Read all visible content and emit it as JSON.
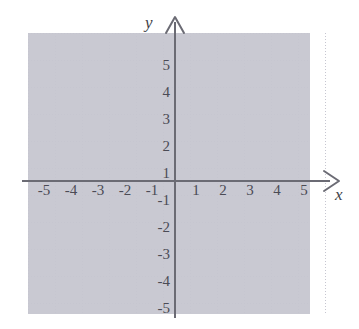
{
  "figure": {
    "kind": "cartesian-coordinate-plane",
    "axis_labels": {
      "x": "x",
      "y": "y"
    },
    "colors": {
      "background": "#ffffff",
      "grid": "#c6c6d0",
      "axis": "#6b6b74",
      "label_text": "#4b4b55"
    }
  },
  "chart_data": {
    "type": "scatter",
    "title": "",
    "xlabel": "x",
    "ylabel": "y",
    "xlim": [
      -5.5,
      5.5
    ],
    "ylim": [
      -5.5,
      5.5
    ],
    "grid": true,
    "legend": "none",
    "series": [],
    "x_ticks": [
      "-5",
      "-4",
      "-3",
      "-2",
      "-1",
      "1",
      "2",
      "3",
      "4",
      "5"
    ],
    "y_ticks": [
      "5",
      "4",
      "3",
      "2",
      "1",
      "-1",
      "-2",
      "-3",
      "-4",
      "-5"
    ],
    "x_tick_values": [
      -5,
      -4,
      -3,
      -2,
      -1,
      1,
      2,
      3,
      4,
      5
    ],
    "y_tick_values": [
      5,
      4,
      3,
      2,
      1,
      -1,
      -2,
      -3,
      -4,
      -5
    ],
    "annotations": []
  },
  "x_axis": {
    "name": "x",
    "ticks": [
      {
        "label": "-5",
        "value": -5
      },
      {
        "label": "-4",
        "value": -4
      },
      {
        "label": "-3",
        "value": -3
      },
      {
        "label": "-2",
        "value": -2
      },
      {
        "label": "-1",
        "value": -1
      },
      {
        "label": "1",
        "value": 1
      },
      {
        "label": "2",
        "value": 2
      },
      {
        "label": "3",
        "value": 3
      },
      {
        "label": "4",
        "value": 4
      },
      {
        "label": "5",
        "value": 5
      }
    ]
  },
  "y_axis": {
    "name": "y",
    "ticks": [
      {
        "label": "5",
        "value": 5
      },
      {
        "label": "4",
        "value": 4
      },
      {
        "label": "3",
        "value": 3
      },
      {
        "label": "2",
        "value": 2
      },
      {
        "label": "1",
        "value": 1
      },
      {
        "label": "-1",
        "value": -1
      },
      {
        "label": "-2",
        "value": -2
      },
      {
        "label": "-3",
        "value": -3
      },
      {
        "label": "-4",
        "value": -4
      },
      {
        "label": "-5",
        "value": -5
      }
    ]
  }
}
